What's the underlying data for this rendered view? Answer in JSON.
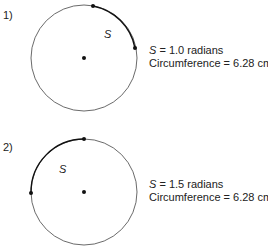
{
  "diagrams": [
    {
      "number": "1)",
      "arc_label": "S",
      "line1_var": "S",
      "line1_rest": " = 1.0 radians",
      "line2": "Circumference = 6.28 cm",
      "angle_radians": 1.0
    },
    {
      "number": "2)",
      "arc_label": "S",
      "line1_var": "S",
      "line1_rest": " = 1.5 radians",
      "line2": "Circumference = 6.28 cm",
      "angle_radians": 1.5
    }
  ]
}
